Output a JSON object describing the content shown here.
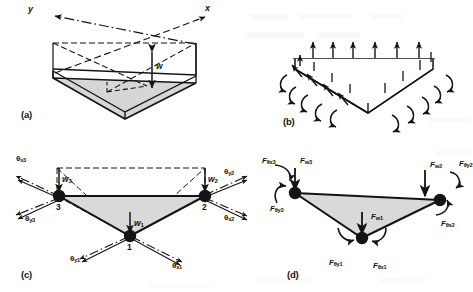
{
  "figure": {
    "panels": [
      {
        "id": "a",
        "letter": "(a)",
        "caption": "geometry and transverse deflection"
      },
      {
        "id": "b",
        "letter": "(b)",
        "caption": "distributed edge loads and moments"
      },
      {
        "id": "c",
        "letter": "(c)",
        "caption": "nodal degrees of freedom"
      },
      {
        "id": "d",
        "letter": "(d)",
        "caption": "nodal forces and moments"
      }
    ]
  },
  "colors": {
    "ink": "#141414",
    "plate_fill": "#d8d8d8",
    "plate_fill_light": "#e6e6e6",
    "background": "#ffffff"
  },
  "panel_a": {
    "letter": "(a)",
    "axes": [
      {
        "name": "y-axis",
        "label": "y",
        "direction": "upper-left"
      },
      {
        "name": "x-axis",
        "label": "x",
        "direction": "upper-right"
      }
    ],
    "deflection": {
      "label": "w",
      "arrow": "double-headed-vertical"
    }
  },
  "panel_b": {
    "letter": "(b)",
    "loads": {
      "transverse_arrows": 6,
      "edge_arrows_left": 5,
      "edge_arrows_right": 4,
      "moment_arrows_left": 5,
      "moment_arrows_right": 5
    }
  },
  "panel_c": {
    "letter": "(c)",
    "nodes": [
      {
        "id": "1",
        "label": "1",
        "w": "w",
        "w_sub": "1",
        "theta_x": "θ",
        "theta_x_sub": "x1",
        "theta_y": "θ",
        "theta_y_sub": "y1"
      },
      {
        "id": "2",
        "label": "2",
        "w": "w",
        "w_sub": "2",
        "theta_x": "θ",
        "theta_x_sub": "x2",
        "theta_y": "θ",
        "theta_y_sub": "y2"
      },
      {
        "id": "3",
        "label": "3",
        "w": "w",
        "w_sub": "3",
        "theta_x": "θ",
        "theta_x_sub": "x3",
        "theta_y": "θ",
        "theta_y_sub": "y3"
      }
    ]
  },
  "panel_d": {
    "letter": "(d)",
    "forces": [
      {
        "node": "1",
        "F_w": "F",
        "F_w_sub": "w1",
        "F_tx": "F",
        "F_tx_sub": "θx1",
        "F_ty": "F",
        "F_ty_sub": "θy1"
      },
      {
        "node": "2",
        "F_w": "F",
        "F_w_sub": "w2",
        "F_tx": "F",
        "F_tx_sub": "θx2",
        "F_ty": "F",
        "F_ty_sub": "θy2"
      },
      {
        "node": "3",
        "F_w": "F",
        "F_w_sub": "w3",
        "F_tx": "F",
        "F_tx_sub": "θx3",
        "F_ty": "F",
        "F_ty_sub": "θy3"
      }
    ]
  }
}
